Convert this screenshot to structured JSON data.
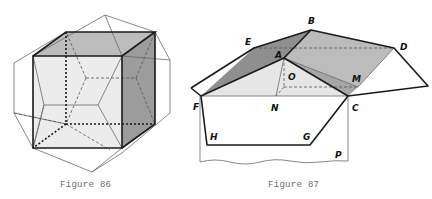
{
  "figures": [
    {
      "id": "fig86",
      "caption": "Figure 86",
      "description": "Cube inscribed in a dodecahedron (wireframe with hidden dashed edges)",
      "colors": {
        "front_face": "#ececec",
        "top_face": "#bdbdbd",
        "side_face": "#9c9c9c",
        "edge": "#1a1a1a",
        "thin": "#6a6a6a"
      }
    },
    {
      "id": "fig87",
      "caption": "Figure 87",
      "description": "Roof construction on a cube face, with labeled points",
      "labels": {
        "A": "A",
        "B": "B",
        "C": "C",
        "D": "D",
        "E": "E",
        "F": "F",
        "G": "G",
        "H": "H",
        "M": "M",
        "N": "N",
        "O": "O",
        "P": "P"
      },
      "colors": {
        "dark_face": "#8f8f8f",
        "mid_face": "#bcbcbc",
        "light_face": "#e6e6e6",
        "edge": "#1a1a1a",
        "dash": "#555555"
      }
    }
  ]
}
